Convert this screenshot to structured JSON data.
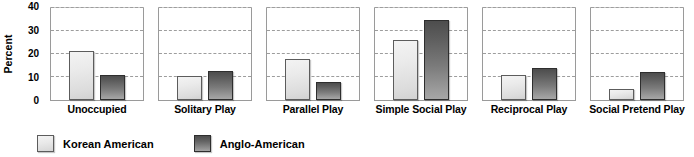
{
  "chart_data": {
    "type": "bar",
    "title": "",
    "xlabel": "",
    "ylabel": "Percent",
    "ylim": [
      0,
      40
    ],
    "yticks": [
      0,
      10,
      20,
      30,
      40
    ],
    "ytick_labels": [
      "0",
      "10",
      "20",
      "30",
      "40"
    ],
    "grid": true,
    "grid_axis": "y",
    "legend_position": "bottom-left",
    "panel_layout": "six side-by-side panels sharing one y-axis",
    "categories": [
      "Unoccupied",
      "Solitary Play",
      "Parallel Play",
      "Simple Social Play",
      "Reciprocal Play",
      "Social Pretend Play"
    ],
    "series": [
      {
        "name": "Korean American",
        "color": "#e9e9e9",
        "values": [
          21.5,
          10.3,
          18.0,
          26.0,
          11.0,
          5.0
        ]
      },
      {
        "name": "Anglo-American",
        "color": "#6e6e6e",
        "values": [
          11.0,
          12.5,
          8.0,
          35.0,
          14.0,
          12.0
        ]
      }
    ]
  },
  "legend": {
    "items": [
      {
        "label": "Korean American",
        "swatch": "light-gray-square"
      },
      {
        "label": "Anglo-American",
        "swatch": "dark-gray-square"
      }
    ]
  }
}
